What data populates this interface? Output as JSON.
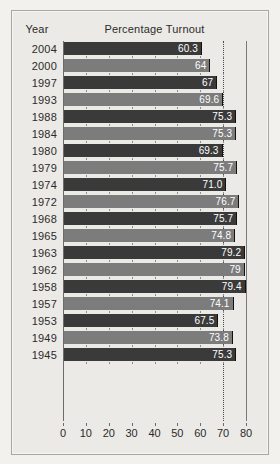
{
  "header": {
    "year_label": "Year",
    "title": "Percentage Turnout"
  },
  "chart_data": {
    "type": "bar",
    "orientation": "horizontal",
    "title": "Percentage Turnout",
    "xlabel": "",
    "ylabel": "Year",
    "xlim": [
      0,
      80
    ],
    "xticks": [
      0,
      10,
      20,
      30,
      40,
      50,
      60,
      70,
      80
    ],
    "xtick_labels": [
      "0",
      "10",
      "20",
      "30",
      "40",
      "50",
      "60",
      "70",
      "80"
    ],
    "grid": false,
    "legend": "none",
    "reference_line": 70,
    "categories": [
      "2004",
      "2000",
      "1997",
      "1993",
      "1988",
      "1984",
      "1980",
      "1979",
      "1974",
      "1972",
      "1968",
      "1965",
      "1963",
      "1962",
      "1958",
      "1957",
      "1953",
      "1949",
      "1945"
    ],
    "values": [
      60.3,
      64,
      67,
      69.6,
      75.3,
      75.3,
      69.3,
      75.7,
      71.0,
      76.7,
      75.7,
      74.8,
      79.2,
      79,
      79.4,
      74.1,
      67.5,
      73.8,
      75.3
    ],
    "value_labels": [
      "60.3",
      "64",
      "67",
      "69.6",
      "75.3",
      "75.3",
      "69.3",
      "75.7",
      "71.0",
      "76.7",
      "75.7",
      "74.8",
      "79.2",
      "79",
      "79.4",
      "74.1",
      "67.5",
      "73.8",
      "75.3"
    ],
    "bar_colors": [
      "#3a3a3a",
      "#7c7c7c",
      "#3a3a3a",
      "#7c7c7c",
      "#3a3a3a",
      "#7c7c7c",
      "#3a3a3a",
      "#7c7c7c",
      "#3a3a3a",
      "#7c7c7c",
      "#3a3a3a",
      "#7c7c7c",
      "#3a3a3a",
      "#7c7c7c",
      "#3a3a3a",
      "#7c7c7c",
      "#3a3a3a",
      "#7c7c7c",
      "#3a3a3a"
    ]
  },
  "colors": {
    "page_background": "#f2f1ee",
    "panel_background": "#eceae6",
    "frame_border": "#a8a6a1",
    "bar_dark": "#3a3a3a",
    "bar_light": "#7c7c7c",
    "value_text": "#ffffff",
    "axis": "#6b6b6b",
    "label_text": "#2b2b2b"
  }
}
